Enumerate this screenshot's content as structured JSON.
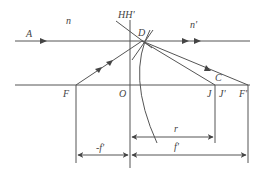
{
  "diagram": {
    "labels": {
      "A": "A",
      "n": "n",
      "n_prime": "n'",
      "HH_prime": "HH'",
      "D": "D",
      "C": "C",
      "F": "F",
      "O": "O",
      "J": "J",
      "J_prime": "J'",
      "F_prime": "F'",
      "minus_f_prime": "-f'",
      "r": "r",
      "f_prime": "f'"
    },
    "colors": {
      "line": "#555555",
      "text": "#444444"
    }
  }
}
